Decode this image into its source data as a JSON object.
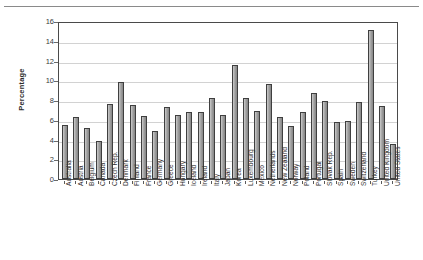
{
  "chart_data": {
    "type": "bar",
    "title": "",
    "subtitle": "",
    "xlabel": "",
    "ylabel": "Percentage",
    "ylim": [
      0,
      16
    ],
    "ytick_values": [
      0,
      2,
      4,
      6,
      8,
      10,
      12,
      14,
      16
    ],
    "ytick_labels": [
      "0",
      "2",
      "4",
      "6",
      "8",
      "10",
      "12",
      "14",
      "16"
    ],
    "grid": "horizontal",
    "legend": "none",
    "bar_color": "#8f8f8f",
    "bar_edge_color": "#3f3f3f",
    "categories": [
      "Australia",
      "Austria",
      "Belgium",
      "Canada",
      "Czech Rep.",
      "Denmark",
      "Finland",
      "France",
      "Germany",
      "Greece",
      "Hungary",
      "Iceland",
      "Ireland",
      "Italy",
      "Japan",
      "Korea",
      "Luxembourg",
      "Mexico",
      "Netherlands",
      "New Zealand",
      "Norway",
      "Poland",
      "Portugal",
      "Slovak Rep.",
      "Spain",
      "Sweden",
      "Switzerland",
      "Turkey",
      "United Kingdom",
      "United States"
    ],
    "values": [
      5.5,
      6.3,
      5.2,
      3.8,
      7.6,
      9.8,
      7.5,
      6.4,
      4.9,
      7.3,
      6.5,
      6.8,
      6.8,
      8.2,
      6.5,
      11.5,
      8.2,
      6.9,
      9.6,
      6.3,
      5.4,
      6.8,
      8.7,
      7.9,
      5.8,
      5.9,
      7.8,
      15.1,
      7.4,
      3.5
    ]
  }
}
